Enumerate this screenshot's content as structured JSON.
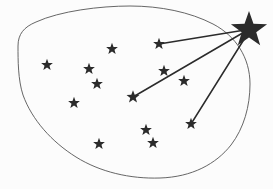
{
  "diagram": {
    "canvas": {
      "width": 273,
      "height": 189
    },
    "background_color": "#fcfcfc",
    "region": {
      "name": "enclosing-blob",
      "stroke_color": "#555555",
      "stroke_width": 0.9,
      "fill": "none",
      "path": "M 18,46 C 18,34 24,27 36,22 C 60,11 100,6 130,6 C 160,6 190,12 213,24 C 236,36 250,58 250,84 C 250,106 244,128 231,145 C 216,164 192,177 160,178 C 130,179 100,172 76,157 C 52,142 32,120 23,95 C 18,80 18,60 18,46 Z"
    },
    "main_star": {
      "name": "bright-star",
      "label": "big-star",
      "cx": 249,
      "cy": 30,
      "outer_radius": 19,
      "inner_radius": 7.6,
      "color": "#2b2b2b"
    },
    "cluster_stars": [
      {
        "id": "s1",
        "cx": 47,
        "cy": 65,
        "r": 6.2,
        "color": "#2b2b2b",
        "connected": false
      },
      {
        "id": "s2",
        "cx": 112,
        "cy": 49,
        "r": 6.2,
        "color": "#2b2b2b",
        "connected": false
      },
      {
        "id": "s3",
        "cx": 89,
        "cy": 69,
        "r": 6.2,
        "color": "#2b2b2b",
        "connected": false
      },
      {
        "id": "s4",
        "cx": 97,
        "cy": 84,
        "r": 6.2,
        "color": "#2b2b2b",
        "connected": false
      },
      {
        "id": "s5",
        "cx": 74,
        "cy": 103,
        "r": 6.2,
        "color": "#2b2b2b",
        "connected": false
      },
      {
        "id": "s6",
        "cx": 159,
        "cy": 44,
        "r": 6.2,
        "color": "#2b2b2b",
        "connected": true
      },
      {
        "id": "s7",
        "cx": 164,
        "cy": 71,
        "r": 6.2,
        "color": "#2b2b2b",
        "connected": false
      },
      {
        "id": "s8",
        "cx": 184,
        "cy": 81,
        "r": 6.2,
        "color": "#2b2b2b",
        "connected": false
      },
      {
        "id": "s9",
        "cx": 133,
        "cy": 97,
        "r": 6.8,
        "color": "#2b2b2b",
        "connected": true
      },
      {
        "id": "s10",
        "cx": 191,
        "cy": 124,
        "r": 6.2,
        "color": "#2b2b2b",
        "connected": true
      },
      {
        "id": "s11",
        "cx": 146,
        "cy": 130,
        "r": 6.2,
        "color": "#2b2b2b",
        "connected": false
      },
      {
        "id": "s12",
        "cx": 153,
        "cy": 143,
        "r": 6.2,
        "color": "#2b2b2b",
        "connected": false
      },
      {
        "id": "s13",
        "cx": 99,
        "cy": 144,
        "r": 6.2,
        "color": "#2b2b2b",
        "connected": false
      }
    ],
    "connections": [
      {
        "id": "c1",
        "from": "s6",
        "x1": 159,
        "y1": 44,
        "x2": 245,
        "y2": 30,
        "stroke_color": "#2b2b2b",
        "stroke_width": 1.5
      },
      {
        "id": "c2",
        "from": "s9",
        "x1": 133,
        "y1": 97,
        "x2": 246,
        "y2": 31,
        "stroke_color": "#2b2b2b",
        "stroke_width": 1.5
      },
      {
        "id": "c3",
        "from": "s10",
        "x1": 191,
        "y1": 124,
        "x2": 248,
        "y2": 33,
        "stroke_color": "#2b2b2b",
        "stroke_width": 1.5
      }
    ]
  }
}
